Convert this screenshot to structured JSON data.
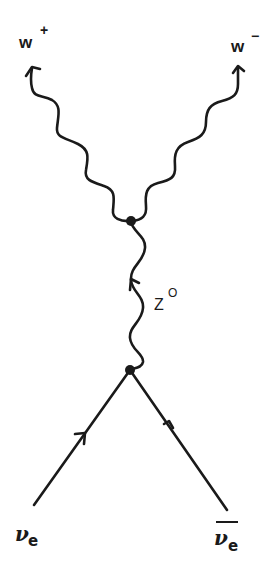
{
  "diagram": {
    "type": "feynman",
    "process": "neutrino-antineutrino annihilation to W+ W- via Z0",
    "colors": {
      "ink": "#1a1a1a",
      "background": "#ffffff"
    },
    "labels": {
      "w_plus": {
        "base": "w",
        "sup": "+"
      },
      "w_minus": {
        "base": "w",
        "sup": "−"
      },
      "z_boson": {
        "base": "Z",
        "sup": "O"
      },
      "nu_e": {
        "base": "ν",
        "sub": "e"
      },
      "nu_e_bar": {
        "base": "ν",
        "sub": "e"
      }
    },
    "vertices": [
      {
        "id": "top",
        "x": 131,
        "y": 221
      },
      {
        "id": "bottom",
        "x": 130,
        "y": 370
      }
    ],
    "propagators": [
      {
        "from": "top",
        "to": "W+",
        "style": "wavy",
        "arrow": "outgoing"
      },
      {
        "from": "top",
        "to": "W-",
        "style": "wavy",
        "arrow": "outgoing"
      },
      {
        "from": "bottom",
        "to": "top",
        "style": "wavy",
        "label": "Z0",
        "arrow": "upward"
      },
      {
        "from": "nu_e",
        "to": "bottom",
        "style": "straight",
        "arrow": "toward-vertex"
      },
      {
        "from": "nu_e_bar",
        "to": "bottom",
        "style": "straight",
        "arrow": "toward-vertex"
      }
    ]
  }
}
